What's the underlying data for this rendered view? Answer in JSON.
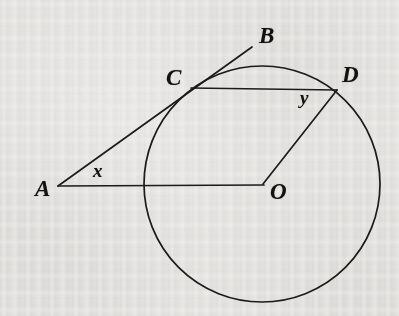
{
  "figure": {
    "kind": "circle-geometry-diagram",
    "width": 399,
    "height": 316,
    "background_color": "#f1f0ee",
    "stroke_color": "#1d1b18",
    "label_color": "#14120f"
  },
  "labels": {
    "A": "A",
    "B": "B",
    "C": "C",
    "D": "D",
    "O": "O",
    "x": "x",
    "y": "y"
  },
  "geometry": {
    "circle": {
      "cx": 262,
      "cy": 184,
      "r": 118
    },
    "points": {
      "A": {
        "x": 58,
        "y": 186
      },
      "B": {
        "x": 252,
        "y": 47
      },
      "C": {
        "x": 191,
        "y": 88
      },
      "D": {
        "x": 337,
        "y": 90
      },
      "O": {
        "x": 263,
        "y": 184
      }
    },
    "segments": [
      {
        "name": "tangent-ACB",
        "from": "A",
        "to": "B"
      },
      {
        "name": "secant-AO",
        "from": "A",
        "to": "O"
      },
      {
        "name": "chord-CD",
        "from": "C",
        "to": "D"
      },
      {
        "name": "radius-OD",
        "from": "O",
        "to": "D"
      }
    ],
    "angles": [
      {
        "name": "angle-x",
        "vertex": "A",
        "label": "x"
      },
      {
        "name": "angle-y",
        "vertex": "D",
        "label": "y"
      }
    ]
  }
}
